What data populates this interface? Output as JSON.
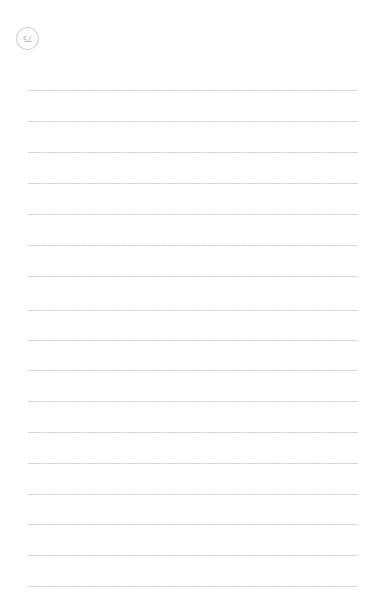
{
  "document": {
    "type": "ruled-notebook-page",
    "background_color": "#ffffff",
    "page_width": 386,
    "page_height": 600
  },
  "page_number": {
    "value": "75",
    "display_rotated_180": true,
    "badge_shape": "circle",
    "badge_border_color": "#c9c9cc",
    "text_color": "#8a8a8f",
    "badge_diameter_px": 23,
    "position": {
      "left": 16,
      "top": 27
    }
  },
  "ruled_lines": {
    "count": 17,
    "color": "#dddddf",
    "style": "faint dashed/dotted rule",
    "left_px": 28,
    "right_px": 358,
    "width_px": 330,
    "spacing_px": 31,
    "y_positions": [
      90,
      121,
      152,
      183,
      214,
      245,
      276,
      310,
      340,
      370,
      401,
      432,
      463,
      494,
      524,
      555,
      586
    ]
  }
}
